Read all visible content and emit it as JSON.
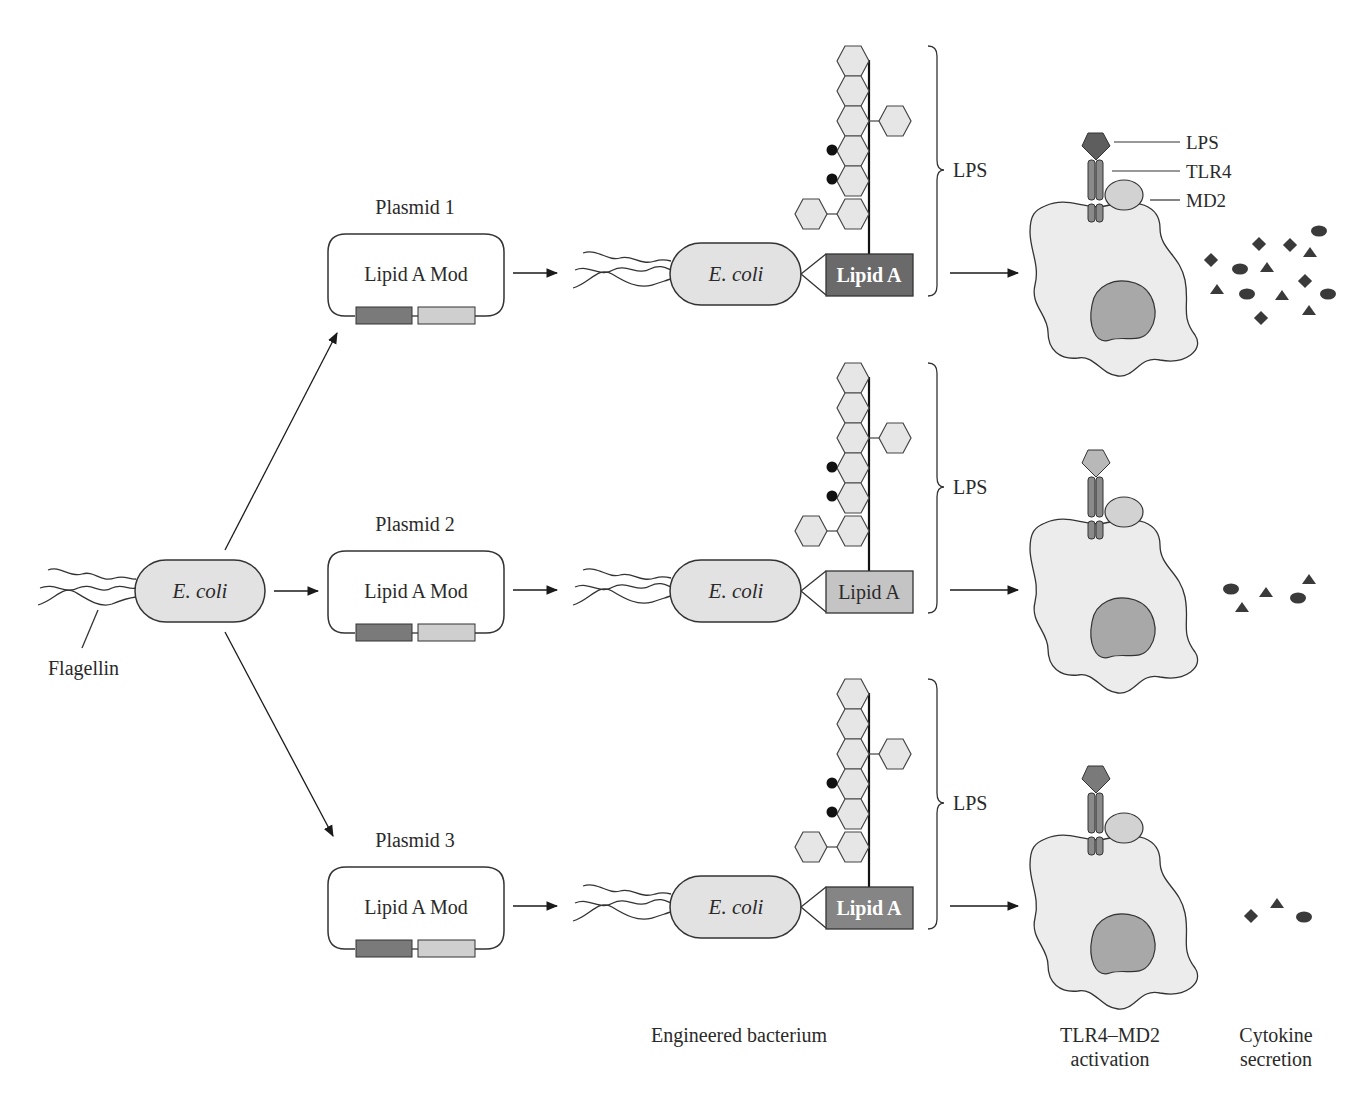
{
  "colors": {
    "stroke": "#2a2a2a",
    "cell_fill": "#ececec",
    "ecoli_fill": "#e2e2e2",
    "hex_fill": "#e6e6e6",
    "plasmid_dark": "#7a7a7a",
    "plasmid_light": "#cfcfcf",
    "lipidA_dark": "#6a6a6a",
    "lipidA_light": "#c4c4c4",
    "lipidA_mid": "#858585",
    "tlr4_fill": "#8a8a8a",
    "md2_fill": "#d2d2d2",
    "nucleus_fill": "#a8a8a8",
    "cytokine_fill": "#3a3a3a"
  },
  "origin": {
    "ecoli_label": "E. coli",
    "flagellin_label": "Flagellin"
  },
  "rows": [
    {
      "plasmid_title": "Plasmid 1",
      "plasmid_gene": "Lipid A Mod",
      "ecoli_label": "E. coli",
      "lipidA_label": "Lipid A",
      "lipidA_style": "dark",
      "lps_label": "LPS",
      "ligand_style": "dark",
      "receptor_labels": [
        "LPS",
        "TLR4",
        "MD2"
      ],
      "cytokine_level": "high"
    },
    {
      "plasmid_title": "Plasmid 2",
      "plasmid_gene": "Lipid A Mod",
      "ecoli_label": "E. coli",
      "lipidA_label": "Lipid A",
      "lipidA_style": "light",
      "lps_label": "LPS",
      "ligand_style": "light",
      "cytokine_level": "low"
    },
    {
      "plasmid_title": "Plasmid 3",
      "plasmid_gene": "Lipid A Mod",
      "ecoli_label": "E. coli",
      "lipidA_label": "Lipid A",
      "lipidA_style": "medium",
      "lps_label": "LPS",
      "ligand_style": "dark",
      "cytokine_level": "minimal"
    }
  ],
  "footer": {
    "engineered": "Engineered bacterium",
    "activation_line1": "TLR4–MD2",
    "activation_line2": "activation",
    "cytokine_line1": "Cytokine",
    "cytokine_line2": "secretion"
  }
}
